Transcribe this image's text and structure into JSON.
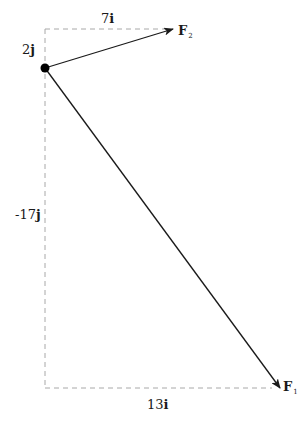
{
  "diagram": {
    "type": "vector-decomposition",
    "origin": {
      "x": 45,
      "y": 68
    },
    "vectors": [
      {
        "name": "F2",
        "label": "F",
        "subscript": "2",
        "tip": {
          "x": 173,
          "y": 29
        },
        "components": {
          "i": "7i",
          "j": "2j"
        }
      },
      {
        "name": "F1",
        "label": "F",
        "subscript": "1",
        "tip": {
          "x": 280,
          "y": 388
        },
        "components": {
          "i": "13i",
          "j": "-17j"
        }
      }
    ],
    "labels": {
      "f2_i_component": {
        "coef": "7",
        "unit": "i"
      },
      "f2_j_component": {
        "coef": "2",
        "unit": "j"
      },
      "f1_i_component": {
        "coef": "13",
        "unit": "i"
      },
      "f1_j_component": {
        "coef": "-17",
        "unit": "j"
      },
      "f2_name": {
        "base": "F",
        "sub": "2"
      },
      "f1_name": {
        "base": "F",
        "sub": "1"
      }
    },
    "colors": {
      "vector": "#1a1a1a",
      "dashed": "#a8a8a8",
      "point": "#000000",
      "text": "#1a1a1a"
    }
  }
}
